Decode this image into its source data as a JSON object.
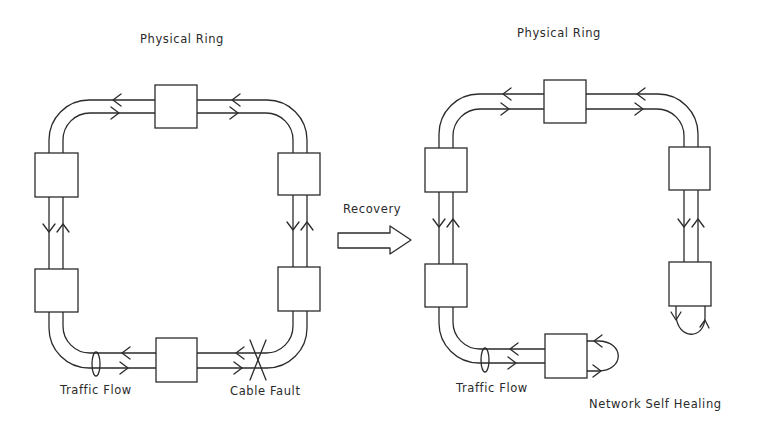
{
  "diagram": {
    "type": "network-ring-recovery",
    "colors": {
      "line": "#2b2b2b",
      "background": "#ffffff",
      "text": "#2a2a2a"
    },
    "left_panel": {
      "title": "Physical Ring",
      "state": "before-recovery",
      "nodes": 6,
      "labels": {
        "traffic": "Traffic Flow",
        "fault": "Cable Fault"
      }
    },
    "transition": {
      "label": "Recovery",
      "icon": "hollow-right-arrow"
    },
    "right_panel": {
      "title": "Physical Ring",
      "state": "after-recovery",
      "nodes": 6,
      "labels": {
        "traffic": "Traffic Flow",
        "healing": "Network Self Healing"
      }
    }
  }
}
